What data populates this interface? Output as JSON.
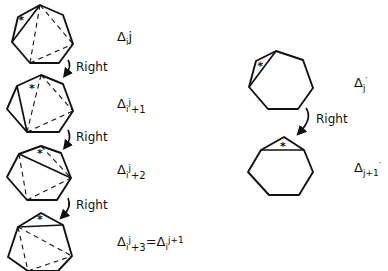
{
  "diagram": {
    "left_column": {
      "steps": [
        {
          "label": {
            "delta": "Δ",
            "sub": "i",
            "sup": "j",
            "post": ""
          },
          "star": "*"
        },
        {
          "label": {
            "delta": "Δ",
            "sub": "i",
            "sup": "j",
            "post": "+1"
          },
          "star": "*"
        },
        {
          "label": {
            "delta": "Δ",
            "sub": "i",
            "sup": "j",
            "post": "+2"
          },
          "star": "*"
        },
        {
          "label": {
            "delta": "Δ",
            "sub": "i",
            "sup": "j",
            "post": "+3",
            "eq": "=",
            "delta2": "Δ",
            "sub2": "i",
            "sup2": "j+1"
          },
          "star": "*"
        }
      ],
      "arrows": [
        {
          "label": "Right"
        },
        {
          "label": "Right"
        },
        {
          "label": "Right"
        }
      ]
    },
    "right_column": {
      "steps": [
        {
          "label": {
            "delta": "Δ",
            "sub": "j",
            "prime": "′"
          },
          "star": "*"
        },
        {
          "label": {
            "delta": "Δ",
            "sub": "j+1",
            "prime": "′"
          },
          "star": "*"
        }
      ],
      "arrows": [
        {
          "label": "Right"
        }
      ]
    }
  }
}
